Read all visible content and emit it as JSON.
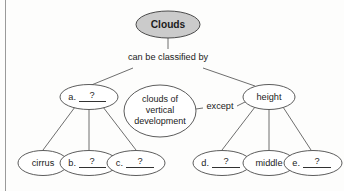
{
  "diagram": {
    "type": "concept-map",
    "colors": {
      "root_fill": "#cbcbcb",
      "node_fill": "#ffffff",
      "stroke": "#4a4a4a",
      "text": "#1b1b1b",
      "background": "#fdfdfc"
    },
    "root": {
      "label": "Clouds"
    },
    "connector_labels": {
      "classified_by": "can be classified by",
      "except": "except"
    },
    "level2": [
      {
        "id": "a",
        "prefix": "a.",
        "answer": "?",
        "blank": true,
        "label": "a. ?"
      },
      {
        "id": "vertical",
        "prefix": "",
        "answer": "",
        "blank": false,
        "label": "clouds of vertical development",
        "lines": [
          "clouds of",
          "vertical",
          "development"
        ]
      },
      {
        "id": "height",
        "prefix": "",
        "answer": "",
        "blank": false,
        "label": "height"
      }
    ],
    "level3": [
      {
        "id": "cirrus",
        "prefix": "",
        "answer": "",
        "blank": false,
        "label": "cirrus",
        "parent": "a"
      },
      {
        "id": "b",
        "prefix": "b.",
        "answer": "?",
        "blank": true,
        "label": "b. ?",
        "parent": "a"
      },
      {
        "id": "c",
        "prefix": "c.",
        "answer": "?",
        "blank": true,
        "label": "c. ?",
        "parent": "a"
      },
      {
        "id": "d",
        "prefix": "d.",
        "answer": "?",
        "blank": true,
        "label": "d. ?",
        "parent": "height"
      },
      {
        "id": "middle",
        "prefix": "",
        "answer": "",
        "blank": false,
        "label": "middle",
        "parent": "height"
      },
      {
        "id": "e",
        "prefix": "e.",
        "answer": "?",
        "blank": true,
        "label": "e. ?",
        "parent": "height"
      }
    ]
  }
}
